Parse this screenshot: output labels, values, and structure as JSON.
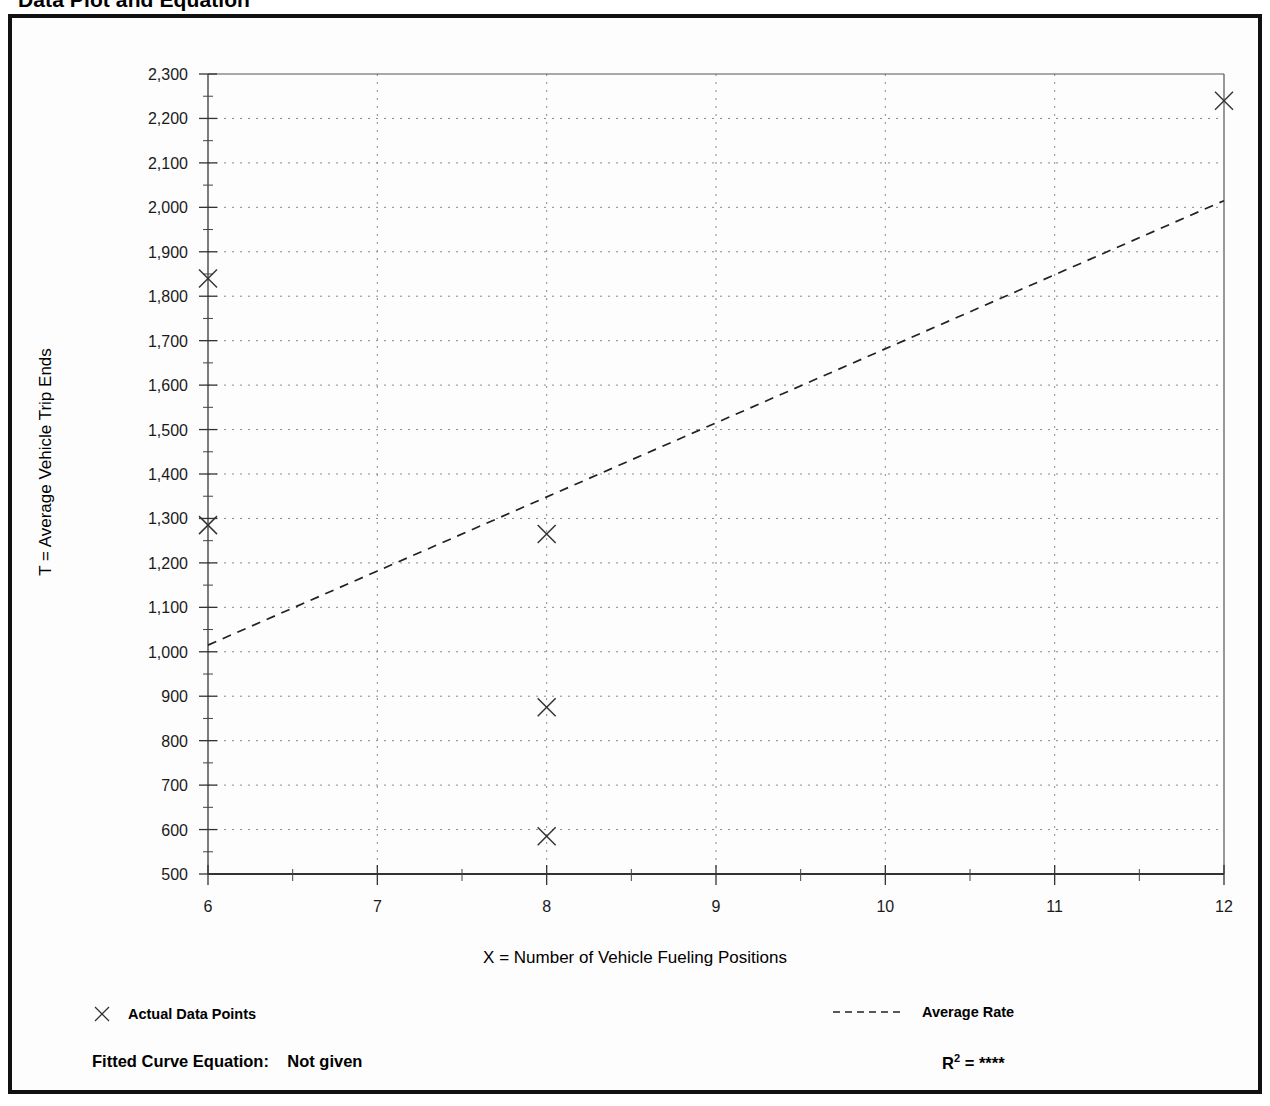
{
  "page": {
    "title": "Data Plot and Equation"
  },
  "legend": {
    "data_points_label": "Actual Data Points",
    "average_rate_label": "Average Rate",
    "marker_icon": "x-marker-icon",
    "line_icon": "dashed-line-icon"
  },
  "equation": {
    "fitted_label": "Fitted Curve Equation:",
    "fitted_value": "Not given",
    "r_label": "R",
    "r_exponent": "2",
    "r_equals": "=",
    "r_value": "****"
  },
  "chart_data": {
    "type": "scatter",
    "title": "Data Plot and Equation",
    "xlabel": "X = Number of Vehicle Fueling Positions",
    "ylabel": "T = Average Vehicle Trip Ends",
    "xlim": [
      6,
      12
    ],
    "ylim": [
      500,
      2300
    ],
    "grid": true,
    "legend_position": "below-axis",
    "xticks": [
      6,
      7,
      8,
      9,
      10,
      11,
      12
    ],
    "xtick_labels": [
      "6",
      "7",
      "8",
      "9",
      "10",
      "11",
      "12"
    ],
    "x_minor_ticks": [
      6.5,
      7.5,
      8.5,
      9.5,
      10.5,
      11.5
    ],
    "yticks": [
      500,
      600,
      700,
      800,
      900,
      1000,
      1100,
      1200,
      1300,
      1400,
      1500,
      1600,
      1700,
      1800,
      1900,
      2000,
      2100,
      2200,
      2300
    ],
    "ytick_labels": [
      "500",
      "600",
      "700",
      "800",
      "900",
      "1,000",
      "1,100",
      "1,200",
      "1,300",
      "1,400",
      "1,500",
      "1,600",
      "1,700",
      "1,800",
      "1,900",
      "2,000",
      "2,100",
      "2,200",
      "2,300"
    ],
    "y_minor_ticks": [
      550,
      650,
      750,
      850,
      950,
      1050,
      1150,
      1250,
      1350,
      1450,
      1550,
      1650,
      1750,
      1850,
      1950,
      2050,
      2150,
      2250
    ],
    "series": [
      {
        "name": "Actual Data Points",
        "type": "scatter",
        "marker": "x",
        "points": [
          {
            "x": 6,
            "y": 1840
          },
          {
            "x": 6,
            "y": 1285
          },
          {
            "x": 8,
            "y": 1265
          },
          {
            "x": 8,
            "y": 875
          },
          {
            "x": 8,
            "y": 585
          },
          {
            "x": 12,
            "y": 2240
          }
        ]
      },
      {
        "name": "Average Rate",
        "type": "line",
        "linestyle": "dashed",
        "points": [
          {
            "x": 6,
            "y": 1015
          },
          {
            "x": 12,
            "y": 2015
          }
        ]
      }
    ]
  }
}
